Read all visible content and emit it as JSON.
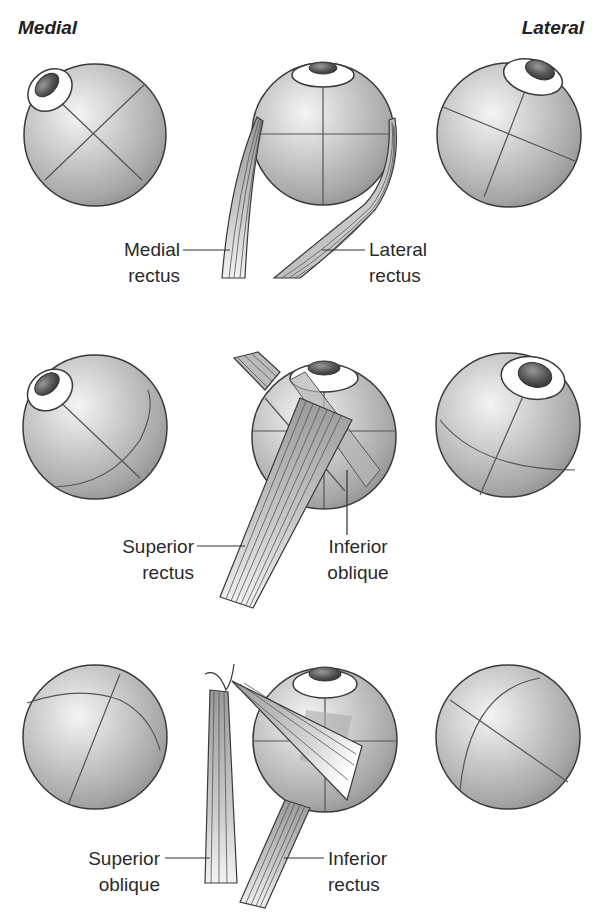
{
  "orientation": {
    "left_label": "Medial",
    "right_label": "Lateral"
  },
  "rows": [
    {
      "id": "horizontal-recti",
      "muscles": [
        {
          "line1": "Medial",
          "line2": "rectus"
        },
        {
          "line1": "Lateral",
          "line2": "rectus"
        }
      ]
    },
    {
      "id": "superior-rectus-inferior-oblique",
      "muscles": [
        {
          "line1": "Superior",
          "line2": "rectus"
        },
        {
          "line1": "Inferior",
          "line2": "oblique"
        }
      ]
    },
    {
      "id": "superior-oblique-inferior-rectus",
      "muscles": [
        {
          "line1": "Superior",
          "line2": "oblique"
        },
        {
          "line1": "Inferior",
          "line2": "rectus"
        }
      ]
    }
  ],
  "colors": {
    "globe_light": "#ececec",
    "globe_dark": "#8e8e8e",
    "outline": "#3a3a3a",
    "pupil": "#4a4a4a",
    "muscle": "#a8a8a8"
  }
}
